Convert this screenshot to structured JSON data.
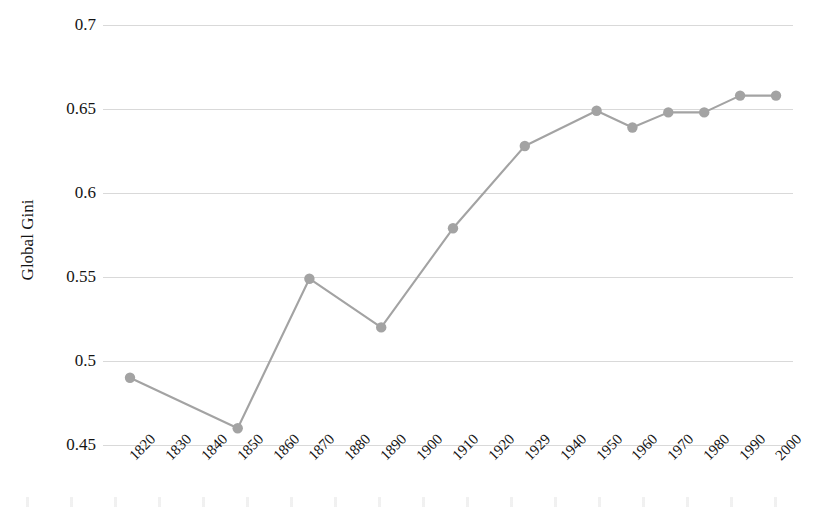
{
  "chart_data": {
    "type": "line",
    "title": "",
    "xlabel": "",
    "ylabel": "Global Gini",
    "ylim": [
      0.45,
      0.7
    ],
    "ytick_labels": [
      "0.7",
      "0.65",
      "0.6",
      "0.55",
      "0.5",
      "0.45"
    ],
    "yticks": [
      0.7,
      0.65,
      0.6,
      0.55,
      0.5,
      0.45
    ],
    "grid": true,
    "legend": "none",
    "categories": [
      "1820",
      "1830",
      "1840",
      "1850",
      "1860",
      "1870",
      "1880",
      "1890",
      "1900",
      "1910",
      "1920",
      "1929",
      "1940",
      "1950",
      "1960",
      "1970",
      "1980",
      "1990",
      "2000"
    ],
    "series": [
      {
        "name": "Global Gini",
        "marker": "circle",
        "color": "#a3a3a3",
        "points": [
          {
            "x": "1820",
            "y": 0.49
          },
          {
            "x": "1850",
            "y": 0.46
          },
          {
            "x": "1870",
            "y": 0.549
          },
          {
            "x": "1890",
            "y": 0.52
          },
          {
            "x": "1910",
            "y": 0.579
          },
          {
            "x": "1929",
            "y": 0.628
          },
          {
            "x": "1950",
            "y": 0.649
          },
          {
            "x": "1960",
            "y": 0.639
          },
          {
            "x": "1970",
            "y": 0.648
          },
          {
            "x": "1980",
            "y": 0.648
          },
          {
            "x": "1990",
            "y": 0.658
          },
          {
            "x": "2000",
            "y": 0.658
          }
        ]
      }
    ]
  },
  "style": {
    "line_color": "#a3a3a3",
    "marker_color": "#a3a3a3",
    "grid_color": "#d9d9d9",
    "text_color": "#141414",
    "background": "#ffffff"
  }
}
